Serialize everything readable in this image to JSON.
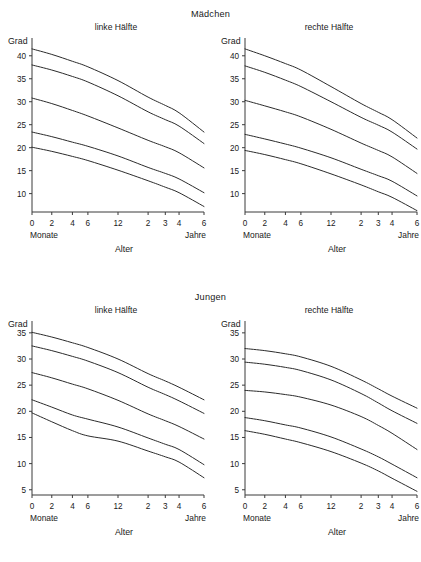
{
  "figure": {
    "groups": [
      {
        "title": "Mädchen",
        "panels": [
          {
            "title": "linke Hälfte",
            "side": "left"
          },
          {
            "title": "rechte Hälfte",
            "side": "right"
          }
        ]
      },
      {
        "title": "Jungen",
        "panels": [
          {
            "title": "linke Hälfte",
            "side": "left"
          },
          {
            "title": "rechte Hälfte",
            "side": "right"
          }
        ]
      }
    ],
    "axis_labels": {
      "y_name": "Grad",
      "x_name": "Alter",
      "x_left_unit": "Monate",
      "x_right_unit": "Jahre"
    }
  },
  "chart_data": [
    {
      "type": "line",
      "title": "Mädchen — linke Hälfte",
      "xlabel": "Alter",
      "ylabel": "Grad",
      "x_unit_left": "Monate",
      "x_unit_right": "Jahre",
      "xticklabels": [
        "0",
        "2",
        "4",
        "6",
        "12",
        "2",
        "3",
        "4",
        "6"
      ],
      "x": [
        0,
        2,
        4,
        6,
        12,
        24,
        36,
        48,
        72
      ],
      "xpos": [
        0,
        0.115,
        0.235,
        0.325,
        0.5,
        0.675,
        0.775,
        0.855,
        1.0
      ],
      "yticks": [
        10,
        15,
        20,
        25,
        30,
        35,
        40
      ],
      "ylim": [
        6,
        43
      ],
      "grid": false,
      "legend": "none",
      "series": [
        {
          "name": "P97",
          "values": [
            41.5,
            40.3,
            38.8,
            37.6,
            34.6,
            31.0,
            29.2,
            27.6,
            23.4
          ]
        },
        {
          "name": "P75",
          "values": [
            38.0,
            36.9,
            35.5,
            34.3,
            31.3,
            27.8,
            26.1,
            24.7,
            20.9
          ]
        },
        {
          "name": "P50",
          "values": [
            30.8,
            29.6,
            28.1,
            26.9,
            24.3,
            21.6,
            20.2,
            18.9,
            15.6
          ]
        },
        {
          "name": "P25",
          "values": [
            23.4,
            22.4,
            21.2,
            20.3,
            18.2,
            15.7,
            14.4,
            13.2,
            10.2
          ]
        },
        {
          "name": "P3",
          "values": [
            20.1,
            19.2,
            18.1,
            17.2,
            15.1,
            12.8,
            11.4,
            10.2,
            7.2
          ]
        }
      ]
    },
    {
      "type": "line",
      "title": "Mädchen — rechte Hälfte",
      "xlabel": "Alter",
      "ylabel": "Grad",
      "x_unit_left": "Monate",
      "x_unit_right": "Jahre",
      "xticklabels": [
        "0",
        "2",
        "4",
        "6",
        "12",
        "2",
        "3",
        "4",
        "6"
      ],
      "x": [
        0,
        2,
        4,
        6,
        12,
        24,
        36,
        48,
        72
      ],
      "xpos": [
        0,
        0.115,
        0.235,
        0.325,
        0.5,
        0.675,
        0.775,
        0.855,
        1.0
      ],
      "yticks": [
        10,
        15,
        20,
        25,
        30,
        35,
        40
      ],
      "ylim": [
        6,
        43
      ],
      "grid": false,
      "legend": "none",
      "series": [
        {
          "name": "P97",
          "values": [
            41.5,
            40.0,
            38.3,
            36.9,
            33.3,
            29.6,
            27.7,
            26.1,
            22.1
          ]
        },
        {
          "name": "P75",
          "values": [
            37.8,
            36.4,
            34.7,
            33.3,
            30.0,
            26.6,
            24.9,
            23.4,
            19.7
          ]
        },
        {
          "name": "P50",
          "values": [
            30.3,
            29.1,
            27.8,
            26.7,
            24.0,
            21.0,
            19.4,
            18.0,
            14.4
          ]
        },
        {
          "name": "P25",
          "values": [
            22.9,
            21.9,
            20.8,
            19.9,
            17.8,
            15.3,
            13.9,
            12.7,
            9.5
          ]
        },
        {
          "name": "P3",
          "values": [
            19.4,
            18.5,
            17.4,
            16.5,
            14.3,
            11.9,
            10.4,
            9.2,
            6.3
          ]
        }
      ]
    },
    {
      "type": "line",
      "title": "Jungen — linke Hälfte",
      "xlabel": "Alter",
      "ylabel": "Grad",
      "x_unit_left": "Monate",
      "x_unit_right": "Jahre",
      "xticklabels": [
        "0",
        "2",
        "4",
        "6",
        "12",
        "2",
        "3",
        "4",
        "6"
      ],
      "x": [
        0,
        2,
        4,
        6,
        12,
        24,
        36,
        48,
        72
      ],
      "xpos": [
        0,
        0.115,
        0.235,
        0.325,
        0.5,
        0.675,
        0.775,
        0.855,
        1.0
      ],
      "yticks": [
        5,
        10,
        15,
        20,
        25,
        30,
        35
      ],
      "ylim": [
        4,
        36.5
      ],
      "grid": false,
      "legend": "none",
      "series": [
        {
          "name": "P97",
          "values": [
            35.1,
            34.2,
            33.1,
            32.2,
            30.0,
            27.2,
            25.8,
            24.6,
            22.2
          ]
        },
        {
          "name": "P75",
          "values": [
            32.5,
            31.6,
            30.5,
            29.6,
            27.4,
            24.6,
            23.2,
            22.0,
            19.6
          ]
        },
        {
          "name": "P50",
          "values": [
            27.4,
            26.4,
            25.2,
            24.3,
            22.1,
            19.5,
            18.2,
            17.1,
            14.7
          ]
        },
        {
          "name": "P25",
          "values": [
            22.2,
            20.8,
            19.3,
            18.5,
            17.0,
            14.9,
            13.7,
            12.7,
            9.8
          ]
        },
        {
          "name": "P3",
          "values": [
            19.7,
            18.0,
            16.3,
            15.3,
            14.3,
            12.4,
            11.3,
            10.3,
            7.3
          ]
        }
      ]
    },
    {
      "type": "line",
      "title": "Jungen — rechte Hälfte",
      "xlabel": "Alter",
      "ylabel": "Grad",
      "x_unit_left": "Monate",
      "x_unit_right": "Jahre",
      "xticklabels": [
        "0",
        "2",
        "4",
        "6",
        "12",
        "2",
        "3",
        "4",
        "6"
      ],
      "x": [
        0,
        2,
        4,
        6,
        12,
        24,
        36,
        48,
        72
      ],
      "xpos": [
        0,
        0.115,
        0.235,
        0.325,
        0.5,
        0.675,
        0.775,
        0.855,
        1.0
      ],
      "yticks": [
        5,
        10,
        15,
        20,
        25,
        30,
        35
      ],
      "ylim": [
        4,
        36.5
      ],
      "grid": false,
      "legend": "none",
      "series": [
        {
          "name": "P97",
          "values": [
            32.0,
            31.6,
            31.0,
            30.4,
            28.6,
            26.0,
            24.3,
            22.9,
            20.6
          ]
        },
        {
          "name": "P75",
          "values": [
            29.4,
            29.0,
            28.4,
            27.8,
            26.0,
            23.4,
            21.6,
            20.1,
            17.7
          ]
        },
        {
          "name": "P50",
          "values": [
            24.0,
            23.7,
            23.2,
            22.7,
            21.2,
            19.0,
            17.3,
            15.8,
            12.7
          ]
        },
        {
          "name": "P25",
          "values": [
            18.8,
            18.2,
            17.4,
            16.8,
            15.1,
            12.8,
            11.3,
            9.9,
            7.3
          ]
        },
        {
          "name": "P3",
          "values": [
            16.3,
            15.6,
            14.7,
            14.0,
            12.3,
            10.1,
            8.6,
            7.2,
            4.7
          ]
        }
      ]
    }
  ]
}
